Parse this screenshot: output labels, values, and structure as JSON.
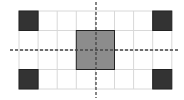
{
  "diagram": {
    "type": "grid-symmetry",
    "grid": {
      "columns": 8,
      "rows": 4,
      "origin_x": 19,
      "origin_y": 11,
      "cell_w": 19.1,
      "cell_h": 19.5,
      "line_color": "#d8d8d8"
    },
    "cells": [
      {
        "name": "corner-top-left",
        "col": 0,
        "row": 0,
        "w": 1,
        "h": 1,
        "fill": "#333333"
      },
      {
        "name": "corner-top-right",
        "col": 7,
        "row": 0,
        "w": 1,
        "h": 1,
        "fill": "#333333"
      },
      {
        "name": "corner-bottom-left",
        "col": 0,
        "row": 3,
        "w": 1,
        "h": 1,
        "fill": "#333333"
      },
      {
        "name": "corner-bottom-right",
        "col": 7,
        "row": 3,
        "w": 1,
        "h": 1,
        "fill": "#333333"
      },
      {
        "name": "center-square",
        "col": 3,
        "row": 1,
        "w": 2,
        "h": 2,
        "fill": "#8c8c8c"
      }
    ],
    "axes": {
      "vertical": {
        "x": 96,
        "y1": 2,
        "y2": 98
      },
      "horizontal": {
        "y": 50,
        "x1": 10,
        "x2": 178
      },
      "stroke": "#444444",
      "dash": "3,2"
    }
  }
}
